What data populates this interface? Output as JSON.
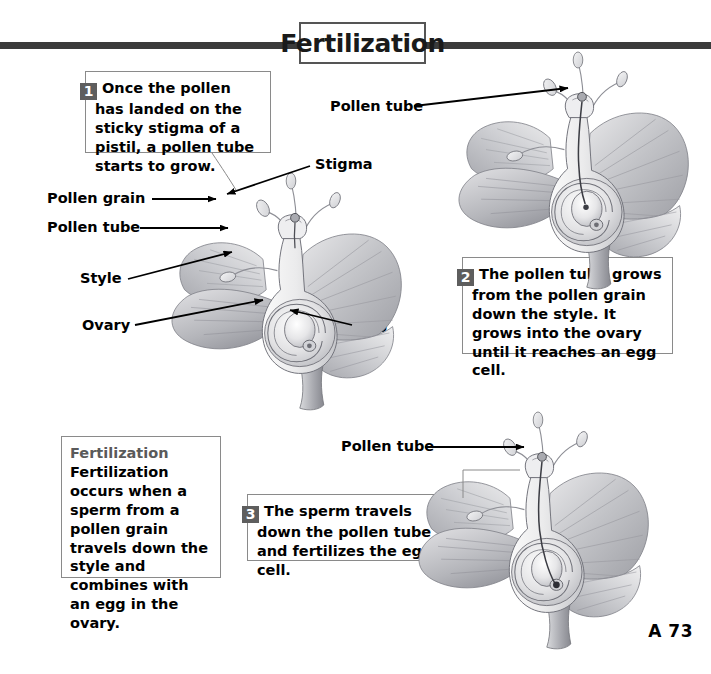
{
  "page": {
    "title": "Fertilization",
    "page_number": "A 73",
    "background_color": "#ffffff",
    "rule_color": "#3b3b3b",
    "badge_color": "#5e5e5e",
    "heading_color": "#5a5a5a"
  },
  "steps": [
    {
      "number": "1",
      "text": "Once the pollen has landed on the sticky stigma of a pistil, a pollen tube starts to grow."
    },
    {
      "number": "2",
      "text": "The pollen tube grows from the pollen grain down the style. It grows into the ovary until it reaches an egg cell."
    },
    {
      "number": "3",
      "text": "The sperm travels down the pollen tube and fertilizes the egg cell."
    }
  ],
  "definition": {
    "heading": "Fertilization",
    "body": "Fertilization occurs when a sperm from a pollen grain travels down the style and combines with an egg in the ovary."
  },
  "labels": {
    "pollen_grain_1": "Pollen grain",
    "pollen_tube_1": "Pollen tube",
    "style_1": "Style",
    "ovary_1": "Ovary",
    "stigma_1": "Stigma",
    "egg_1": "Egg",
    "pollen_tube_2": "Pollen tube",
    "pollen_tube_3": "Pollen tube"
  },
  "figures": [
    {
      "name": "flower-cross-section-1",
      "caption": "Flower cross section with pollen grain on stigma and pollen tube beginning to grow"
    },
    {
      "name": "flower-cross-section-2",
      "caption": "Flower cross section with pollen tube grown down the style into the ovary"
    },
    {
      "name": "flower-cross-section-3",
      "caption": "Flower cross section with sperm traveling down the pollen tube to the egg cell"
    }
  ]
}
